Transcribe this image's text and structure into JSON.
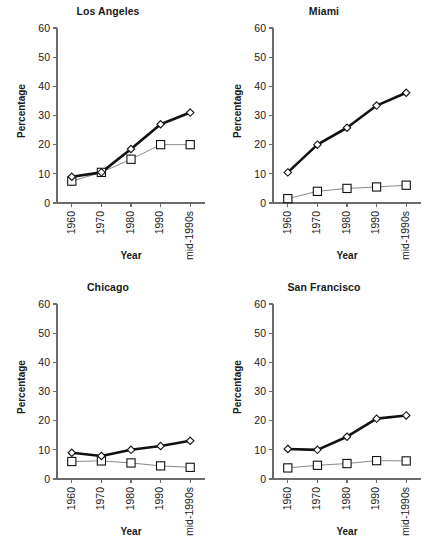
{
  "figure": {
    "axis_label_x": "Year",
    "axis_label_y": "Percentage"
  },
  "chart_data": [
    {
      "type": "line",
      "title": "Los Angeles",
      "xlabel": "Year",
      "ylabel": "Percentage",
      "categories": [
        "1960",
        "1970",
        "1980",
        "1990",
        "mid-1990s"
      ],
      "ylim": [
        0,
        60
      ],
      "yticks": [
        0,
        10,
        20,
        30,
        40,
        50,
        60
      ],
      "grid": false,
      "legend": "none",
      "series": [
        {
          "name": "series-thick-diamond",
          "marker": "diamond",
          "values": [
            9.0,
            10.5,
            18.5,
            27.0,
            31.0
          ]
        },
        {
          "name": "series-thin-square",
          "marker": "square",
          "values": [
            7.5,
            10.5,
            15.0,
            20.0,
            20.0
          ]
        }
      ]
    },
    {
      "type": "line",
      "title": "Miami",
      "xlabel": "Year",
      "ylabel": "Percentage",
      "categories": [
        "1960",
        "1970",
        "1980",
        "1990",
        "mid-1990s"
      ],
      "ylim": [
        0,
        60
      ],
      "yticks": [
        0,
        10,
        20,
        30,
        40,
        50,
        60
      ],
      "grid": false,
      "legend": "none",
      "series": [
        {
          "name": "series-thick-diamond",
          "marker": "diamond",
          "values": [
            10.5,
            20.0,
            25.8,
            33.4,
            37.8
          ]
        },
        {
          "name": "series-thin-square",
          "marker": "square",
          "values": [
            1.5,
            4.0,
            5.0,
            5.5,
            6.1
          ]
        }
      ]
    },
    {
      "type": "line",
      "title": "Chicago",
      "xlabel": "Year",
      "ylabel": "Percentage",
      "categories": [
        "1960",
        "1970",
        "1980",
        "1990",
        "mid-1990s"
      ],
      "ylim": [
        0,
        60
      ],
      "yticks": [
        0,
        10,
        20,
        30,
        40,
        50,
        60
      ],
      "grid": false,
      "legend": "none",
      "series": [
        {
          "name": "series-thick-diamond",
          "marker": "diamond",
          "values": [
            9.0,
            7.9,
            10.0,
            11.3,
            13.1
          ]
        },
        {
          "name": "series-thin-square",
          "marker": "square",
          "values": [
            6.0,
            6.2,
            5.5,
            4.5,
            4.0
          ]
        }
      ]
    },
    {
      "type": "line",
      "title": "San Francisco",
      "xlabel": "Year",
      "ylabel": "Percentage",
      "categories": [
        "1960",
        "1970",
        "1980",
        "1990",
        "mid-1990s"
      ],
      "ylim": [
        0,
        60
      ],
      "yticks": [
        0,
        10,
        20,
        30,
        40,
        50,
        60
      ],
      "grid": false,
      "legend": "none",
      "series": [
        {
          "name": "series-thick-diamond",
          "marker": "diamond",
          "values": [
            10.3,
            10.0,
            14.5,
            20.7,
            21.8
          ]
        },
        {
          "name": "series-thin-square",
          "marker": "square",
          "values": [
            3.8,
            4.7,
            5.3,
            6.3,
            6.2
          ]
        }
      ]
    }
  ]
}
